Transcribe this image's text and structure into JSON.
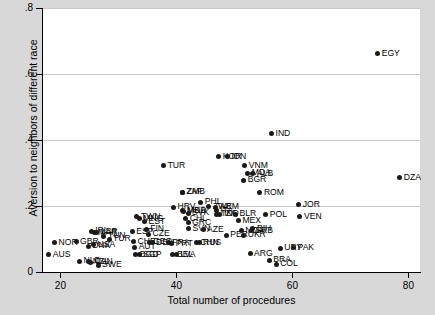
{
  "chart_data": {
    "type": "scatter",
    "title": "",
    "xlabel": "Total number of procedures",
    "ylabel": "Aversion to neighbors of different race",
    "xlim": [
      17,
      82
    ],
    "ylim": [
      0,
      0.8
    ],
    "xticks": [
      20,
      40,
      60,
      80
    ],
    "xtick_labels": [
      "20",
      "40",
      "60",
      "80"
    ],
    "yticks": [
      0,
      0.2,
      0.4,
      0.6,
      0.8
    ],
    "ytick_labels": [
      "0",
      ".2",
      ".4",
      ".6",
      ".8"
    ],
    "grid": "horizontal",
    "legend": "none",
    "point_color": "#1a1a1a",
    "grid_color": "#c9c9c9",
    "panel_color": "#ffffff",
    "figure_color": "#d8d8d8",
    "points": [
      {
        "label": "AUS",
        "x": 18.0,
        "y": 0.052
      },
      {
        "label": "NOR",
        "x": 19.0,
        "y": 0.088
      },
      {
        "label": "GBR",
        "x": 22.7,
        "y": 0.092
      },
      {
        "label": "NLD",
        "x": 23.3,
        "y": 0.033
      },
      {
        "label": "SWE",
        "x": 26.5,
        "y": 0.021
      },
      {
        "label": "CAN",
        "x": 25.2,
        "y": 0.03
      },
      {
        "label": "NZL",
        "x": 24.9,
        "y": 0.031
      },
      {
        "label": "DNK",
        "x": 24.8,
        "y": 0.078
      },
      {
        "label": "IRL",
        "x": 25.3,
        "y": 0.123
      },
      {
        "label": "MAR",
        "x": 25.8,
        "y": 0.119
      },
      {
        "label": "USA",
        "x": 25.7,
        "y": 0.082
      },
      {
        "label": "LBR",
        "x": 26.3,
        "y": 0.12
      },
      {
        "label": "TUN",
        "x": 27.5,
        "y": 0.109
      },
      {
        "label": "TUR2",
        "x": 28.4,
        "y": 0.099
      },
      {
        "label": "ESP",
        "x": 32.4,
        "y": 0.122
      },
      {
        "label": "CHE",
        "x": 32.6,
        "y": 0.092
      },
      {
        "label": "AUT",
        "x": 32.8,
        "y": 0.075
      },
      {
        "label": "BGD",
        "x": 33.0,
        "y": 0.052
      },
      {
        "label": "SGP",
        "x": 33.6,
        "y": 0.053
      },
      {
        "label": "TWN",
        "x": 33.2,
        "y": 0.167
      },
      {
        "label": "MNG",
        "x": 33.6,
        "y": 0.162
      },
      {
        "label": "EST",
        "x": 34.5,
        "y": 0.152
      },
      {
        "label": "FIN",
        "x": 34.8,
        "y": 0.129
      },
      {
        "label": "CZE",
        "x": 35.2,
        "y": 0.114
      },
      {
        "label": "GEO",
        "x": 35.3,
        "y": 0.09
      },
      {
        "label": "DEU",
        "x": 35.8,
        "y": 0.089
      },
      {
        "label": "TUR",
        "x": 37.8,
        "y": 0.322
      },
      {
        "label": "FRA",
        "x": 38.6,
        "y": 0.089
      },
      {
        "label": "PRT",
        "x": 39.2,
        "y": 0.086
      },
      {
        "label": "BEL",
        "x": 39.4,
        "y": 0.052
      },
      {
        "label": "LVA",
        "x": 40.0,
        "y": 0.052
      },
      {
        "label": "HRV",
        "x": 39.5,
        "y": 0.196
      },
      {
        "label": "ZAF",
        "x": 41.0,
        "y": 0.242
      },
      {
        "label": "ZMB",
        "x": 41.1,
        "y": 0.242
      },
      {
        "label": "MDA",
        "x": 41.1,
        "y": 0.185
      },
      {
        "label": "MKD",
        "x": 41.2,
        "y": 0.184
      },
      {
        "label": "SVK",
        "x": 42.0,
        "y": 0.178
      },
      {
        "label": "CHL",
        "x": 41.6,
        "y": 0.161
      },
      {
        "label": "GRC",
        "x": 42.0,
        "y": 0.15
      },
      {
        "label": "SVN",
        "x": 42.1,
        "y": 0.131
      },
      {
        "label": "CHN",
        "x": 43.4,
        "y": 0.089
      },
      {
        "label": "RUS",
        "x": 43.9,
        "y": 0.088
      },
      {
        "label": "PHL",
        "x": 44.2,
        "y": 0.212
      },
      {
        "label": "ZWE",
        "x": 45.6,
        "y": 0.198
      },
      {
        "label": "AZE",
        "x": 44.6,
        "y": 0.128
      },
      {
        "label": "KOR",
        "x": 47.3,
        "y": 0.35
      },
      {
        "label": "IDN",
        "x": 48.8,
        "y": 0.35
      },
      {
        "label": "ARM",
        "x": 46.8,
        "y": 0.196
      },
      {
        "label": "ITA",
        "x": 46.9,
        "y": 0.185
      },
      {
        "label": "TZA",
        "x": 46.9,
        "y": 0.175
      },
      {
        "label": "IND2",
        "x": 47.5,
        "y": 0.175
      },
      {
        "label": "PER",
        "x": 48.6,
        "y": 0.112
      },
      {
        "label": "BLR",
        "x": 50.2,
        "y": 0.175
      },
      {
        "label": "MEX",
        "x": 50.7,
        "y": 0.156
      },
      {
        "label": "NGA",
        "x": 51.2,
        "y": 0.125
      },
      {
        "label": "UKR",
        "x": 51.6,
        "y": 0.111
      },
      {
        "label": "VNM",
        "x": 51.8,
        "y": 0.322
      },
      {
        "label": "MDA2",
        "x": 52.3,
        "y": 0.3
      },
      {
        "label": "BGR",
        "x": 51.6,
        "y": 0.278
      },
      {
        "label": "ALB",
        "x": 53.2,
        "y": 0.298
      },
      {
        "label": "ROM",
        "x": 54.4,
        "y": 0.24
      },
      {
        "label": "BIH",
        "x": 53.2,
        "y": 0.131
      },
      {
        "label": "SRB",
        "x": 52.9,
        "y": 0.125
      },
      {
        "label": "ARG",
        "x": 52.7,
        "y": 0.056
      },
      {
        "label": "IND",
        "x": 56.4,
        "y": 0.419
      },
      {
        "label": "POL",
        "x": 55.4,
        "y": 0.174
      },
      {
        "label": "BRA",
        "x": 56.0,
        "y": 0.035
      },
      {
        "label": "COL",
        "x": 57.2,
        "y": 0.024
      },
      {
        "label": "URY",
        "x": 57.9,
        "y": 0.072
      },
      {
        "label": "PAK",
        "x": 60.2,
        "y": 0.073
      },
      {
        "label": "JOR",
        "x": 61.1,
        "y": 0.204
      },
      {
        "label": "VEN",
        "x": 61.3,
        "y": 0.167
      },
      {
        "label": "EGY",
        "x": 74.7,
        "y": 0.662
      },
      {
        "label": "DZA",
        "x": 78.5,
        "y": 0.285
      }
    ]
  }
}
